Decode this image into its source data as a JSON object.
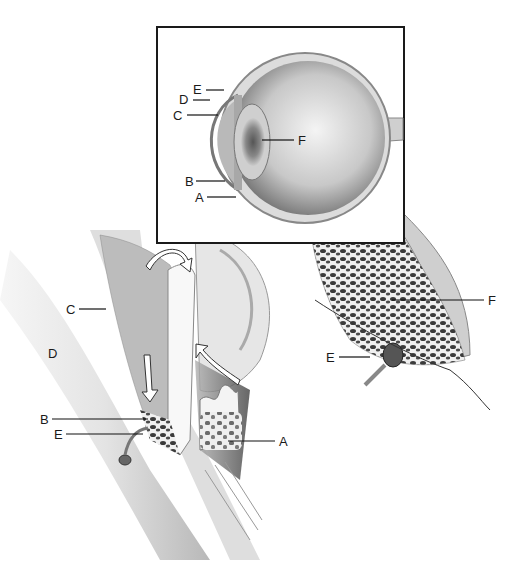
{
  "inset": {
    "labels": [
      {
        "id": "E",
        "text": "E"
      },
      {
        "id": "D",
        "text": "D"
      },
      {
        "id": "C",
        "text": "C"
      },
      {
        "id": "F",
        "text": "F"
      },
      {
        "id": "B",
        "text": "B"
      },
      {
        "id": "A",
        "text": "A"
      }
    ]
  },
  "left_detail": {
    "labels": [
      {
        "id": "C",
        "text": "C"
      },
      {
        "id": "D",
        "text": "D"
      },
      {
        "id": "B",
        "text": "B"
      },
      {
        "id": "E",
        "text": "E"
      },
      {
        "id": "A",
        "text": "A"
      }
    ]
  },
  "right_detail": {
    "labels": [
      {
        "id": "F",
        "text": "F"
      },
      {
        "id": "E",
        "text": "E"
      }
    ]
  }
}
